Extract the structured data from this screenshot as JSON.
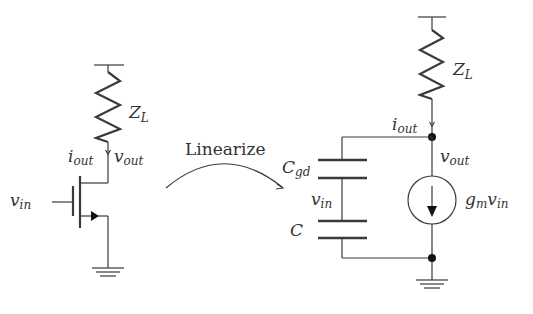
{
  "diagram": {
    "colors": {
      "line": "#3a3a3a",
      "text": "#333333",
      "node": "#111111",
      "background": "#ffffff"
    },
    "left_circuit": {
      "name": "Common-source NMOS stage",
      "labels": {
        "load_main": "Z",
        "load_sub": "L",
        "current_main": "i",
        "current_sub": "out",
        "output_main": "v",
        "output_sub": "out",
        "input_main": "v",
        "input_sub": "in"
      },
      "components": [
        "supply-rail",
        "load-impedance",
        "nmos-transistor",
        "ground"
      ]
    },
    "transition": {
      "label": "Linearize",
      "arrow": "curved-arrow-right"
    },
    "right_circuit": {
      "name": "Small-signal equivalent",
      "labels": {
        "load_main": "Z",
        "load_sub": "L",
        "current_main": "i",
        "current_sub": "out",
        "output_main": "v",
        "output_sub": "out",
        "cgd_main": "C",
        "cgd_sub": "gd",
        "vin_main": "v",
        "vin_sub": "in",
        "c_main": "C",
        "source_main_g": "g",
        "source_sub_m": "m",
        "source_main_v": "v",
        "source_sub_in": "in"
      },
      "components": [
        "supply-rail",
        "load-impedance",
        "capacitor-cgd",
        "capacitor-c",
        "dependent-current-source",
        "ground"
      ]
    }
  }
}
